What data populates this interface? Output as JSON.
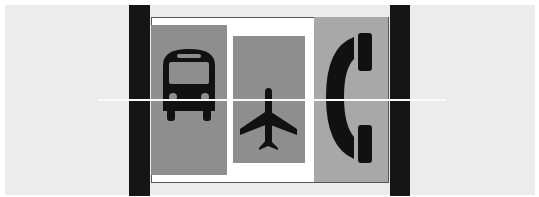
{
  "scene": {
    "description": "Three pictogram signs in grey panels framed between two black vertical bars",
    "colors": {
      "background": "#ececec",
      "bars": "#151515",
      "frame": "#ffffff",
      "panel_dark": "#8e8e8e",
      "panel_light": "#a8a8a8",
      "glyph": "#111111",
      "scanline": "#fafafa"
    },
    "panels": [
      {
        "id": "bus",
        "icon": "bus-icon"
      },
      {
        "id": "plane",
        "icon": "airplane-icon"
      },
      {
        "id": "phone",
        "icon": "telephone-icon"
      }
    ]
  }
}
